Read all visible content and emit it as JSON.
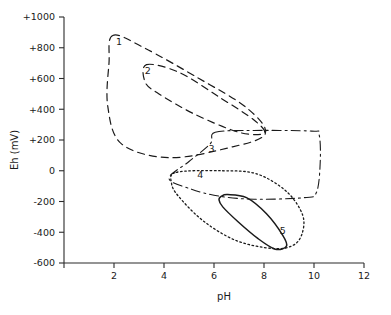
{
  "chart_data": {
    "type": "line",
    "title": "",
    "xlabel": "pH",
    "ylabel": "Eh (mV)",
    "xlim": [
      0,
      12
    ],
    "ylim": [
      -600,
      1000
    ],
    "xticks": [
      0,
      2,
      4,
      6,
      8,
      10,
      12
    ],
    "xticklabels": [
      "",
      "2",
      "4",
      "6",
      "8",
      "10",
      "12"
    ],
    "yticks": [
      -600,
      -400,
      -200,
      0,
      200,
      400,
      600,
      800,
      1000
    ],
    "yticklabels": [
      "-600",
      "-400",
      "-200",
      "0",
      "+200",
      "+400",
      "+600",
      "+800",
      "+1000"
    ],
    "grid": false,
    "legend": "inline-numeric-labels",
    "series": [
      {
        "name": "1",
        "label": "1",
        "linestyle": "dashed",
        "closed": true,
        "points": [
          [
            1.95,
            880
          ],
          [
            3.2,
            800
          ],
          [
            5.4,
            600
          ],
          [
            7.3,
            410
          ],
          [
            8.05,
            240
          ],
          [
            6.6,
            150
          ],
          [
            4.2,
            85
          ],
          [
            2.3,
            175
          ],
          [
            1.75,
            420
          ],
          [
            1.8,
            700
          ],
          [
            1.95,
            880
          ]
        ]
      },
      {
        "name": "2",
        "label": "2",
        "linestyle": "dashed",
        "closed": true,
        "points": [
          [
            3.3,
            690
          ],
          [
            4.6,
            640
          ],
          [
            6.2,
            480
          ],
          [
            7.6,
            330
          ],
          [
            8.0,
            245
          ],
          [
            7.0,
            250
          ],
          [
            5.2,
            370
          ],
          [
            3.8,
            500
          ],
          [
            3.25,
            575
          ],
          [
            3.3,
            690
          ]
        ]
      },
      {
        "name": "3",
        "label": "3",
        "linestyle": "dashdot",
        "closed": true,
        "points": [
          [
            6.05,
            250
          ],
          [
            7.6,
            262
          ],
          [
            9.9,
            258
          ],
          [
            10.2,
            238
          ],
          [
            10.25,
            60
          ],
          [
            10.1,
            -140
          ],
          [
            9.6,
            -175
          ],
          [
            7.6,
            -185
          ],
          [
            6.2,
            -165
          ],
          [
            5.1,
            -120
          ],
          [
            4.2,
            -50
          ],
          [
            5.0,
            60
          ],
          [
            5.85,
            175
          ],
          [
            6.05,
            250
          ]
        ]
      },
      {
        "name": "4",
        "label": "4",
        "linestyle": "dotted",
        "closed": true,
        "points": [
          [
            4.5,
            -10
          ],
          [
            6.3,
            0
          ],
          [
            7.7,
            -20
          ],
          [
            8.9,
            -135
          ],
          [
            9.55,
            -290
          ],
          [
            9.5,
            -420
          ],
          [
            9.1,
            -490
          ],
          [
            8.3,
            -505
          ],
          [
            6.9,
            -455
          ],
          [
            5.6,
            -330
          ],
          [
            4.6,
            -170
          ],
          [
            4.3,
            -80
          ],
          [
            4.5,
            -10
          ]
        ]
      },
      {
        "name": "5",
        "label": "5",
        "linestyle": "solid",
        "closed": true,
        "points": [
          [
            6.55,
            -155
          ],
          [
            7.3,
            -175
          ],
          [
            8.1,
            -280
          ],
          [
            8.75,
            -420
          ],
          [
            8.9,
            -490
          ],
          [
            8.45,
            -510
          ],
          [
            7.75,
            -440
          ],
          [
            6.95,
            -330
          ],
          [
            6.35,
            -235
          ],
          [
            6.2,
            -190
          ],
          [
            6.3,
            -165
          ],
          [
            6.55,
            -155
          ]
        ]
      }
    ],
    "curve_labels": [
      {
        "text": "1",
        "x": 2.2,
        "y": 815
      },
      {
        "text": "2",
        "x": 3.35,
        "y": 630
      },
      {
        "text": "3",
        "x": 5.9,
        "y": 125
      },
      {
        "text": "4",
        "x": 5.45,
        "y": -45
      },
      {
        "text": "5",
        "x": 8.75,
        "y": -410
      }
    ]
  },
  "colors": {
    "axis": "#2b2b2b",
    "curve": "#1a1a1a",
    "background": "#ffffff"
  }
}
